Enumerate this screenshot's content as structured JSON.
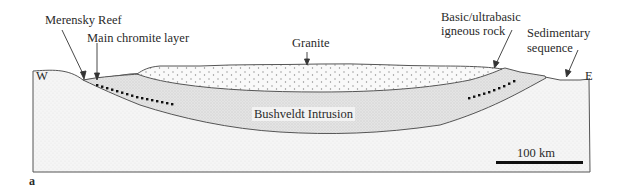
{
  "figure": {
    "panel_label": "a",
    "orientation": {
      "west": "W",
      "east": "E"
    },
    "labels": {
      "merensky_reef": "Merensky Reef",
      "main_chromite_layer": "Main chromite layer",
      "granite": "Granite",
      "basic_ultrabasic_line1": "Basic/ultrabasic",
      "basic_ultrabasic_line2": "igneous rock",
      "sedimentary_line1": "Sedimentary",
      "sedimentary_line2": "sequence",
      "bushveldt_intrusion": "Bushveldt  Intrusion"
    },
    "scale_bar": {
      "label": "100  km"
    },
    "colors": {
      "outline": "#555555",
      "sediment_fill": "#f4f4f4",
      "intrusion_fill": "#e2e2e2",
      "granite_fill": "#f7f7f7",
      "chromite_dots": "#111111",
      "text": "#2a2a2a"
    }
  }
}
